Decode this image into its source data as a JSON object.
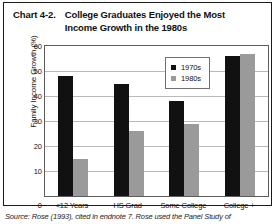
{
  "title": {
    "number": "Chart 4-2.",
    "line1": "College Graduates Enjoyed the Most",
    "line2": "Income Growth in the 1980s"
  },
  "source": "Source: Rose (1993), cited in endnote 7. Rose used the Panel Study of",
  "colors": {
    "series_1970s": "#111111",
    "series_1980s": "#9a9a9a",
    "gridline": "#b9b9b9",
    "axis": "#5c5c5c",
    "frame": "#1a1a1a",
    "background": "#ffffff"
  },
  "chart_data": {
    "type": "bar",
    "title": "College Graduates Enjoyed the Most Income Growth in the 1980s",
    "xlabel": "",
    "ylabel": "Family Income Growth (%)",
    "categories": [
      "<12 Years",
      "HS Grad",
      "Some College",
      "College +"
    ],
    "series": [
      {
        "name": "1970s",
        "values": [
          48,
          45,
          38,
          56
        ]
      },
      {
        "name": "1980s",
        "values": [
          15,
          26,
          29,
          57
        ]
      }
    ],
    "ylim": [
      0,
      60
    ],
    "yticks": [
      0,
      10,
      20,
      30,
      40,
      50,
      60
    ],
    "ytick_labels": [
      "0",
      "10",
      "20",
      "30",
      "40",
      "50",
      "60"
    ],
    "grid": true,
    "legend_position": "upper center"
  }
}
